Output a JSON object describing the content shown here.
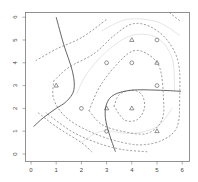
{
  "chart_data": {
    "type": "scatter",
    "title": "",
    "xlabel": "",
    "ylabel": "",
    "xlim": [
      -0.24,
      6.3
    ],
    "ylim": [
      -0.24,
      6.24
    ],
    "grid": false,
    "x_ticks": [
      0,
      1,
      2,
      3,
      4,
      5,
      6
    ],
    "y_ticks": [
      0,
      1,
      2,
      3,
      4,
      5,
      6
    ],
    "series": [
      {
        "name": "circles",
        "marker": "circle",
        "points": [
          [
            5,
            5
          ],
          [
            3,
            4
          ],
          [
            4,
            4
          ],
          [
            5,
            3
          ],
          [
            2,
            2
          ],
          [
            3,
            1
          ]
        ]
      },
      {
        "name": "triangles",
        "marker": "triangle",
        "points": [
          [
            4,
            5
          ],
          [
            5,
            4
          ],
          [
            1,
            3
          ],
          [
            3,
            2
          ],
          [
            4,
            2
          ],
          [
            5,
            1
          ]
        ]
      }
    ],
    "decision_boundary": [
      {
        "style": "solid",
        "points": [
          [
            1,
            6
          ],
          [
            1.3,
            4.8
          ],
          [
            1.65,
            3.6
          ],
          [
            1.7,
            2.8
          ],
          [
            1.4,
            2.3
          ],
          [
            1,
            2
          ],
          [
            0.5,
            1.6
          ],
          [
            0.1,
            1.2
          ]
        ]
      },
      {
        "style": "solid",
        "points": [
          [
            3.35,
            0.1
          ],
          [
            3.1,
            0.9
          ],
          [
            2.95,
            1.6
          ],
          [
            3,
            2.2
          ],
          [
            3.3,
            2.6
          ],
          [
            4,
            2.8
          ],
          [
            5,
            2.8
          ],
          [
            5.95,
            2.75
          ]
        ]
      }
    ],
    "margin_contours": [
      {
        "style": "dashed",
        "points": [
          [
            0.2,
            4.1
          ],
          [
            1,
            4.6
          ],
          [
            2,
            5.1
          ],
          [
            3,
            5.9
          ]
        ]
      },
      {
        "style": "dashed",
        "points": [
          [
            0.9,
            3.2
          ],
          [
            1.5,
            3.8
          ],
          [
            2.5,
            4.4
          ],
          [
            3.3,
            5.2
          ],
          [
            4,
            5.7
          ],
          [
            4.7,
            5.6
          ],
          [
            5.4,
            5
          ],
          [
            5.85,
            4
          ],
          [
            5.9,
            2.5
          ],
          [
            5.8,
            1.2
          ],
          [
            5.2,
            0.6
          ],
          [
            4.3,
            0.4
          ],
          [
            3.3,
            0.6
          ],
          [
            2.3,
            1
          ],
          [
            1.4,
            1.6
          ],
          [
            0.9,
            2.4
          ],
          [
            0.9,
            3.2
          ]
        ]
      },
      {
        "style": "dashed",
        "points": [
          [
            4.6,
            0.1
          ],
          [
            3.6,
            0.2
          ],
          [
            2.6,
            0.5
          ],
          [
            1.6,
            1
          ],
          [
            0.6,
            1.8
          ]
        ]
      },
      {
        "style": "dashed",
        "points": [
          [
            2.3,
            1.9
          ],
          [
            2.7,
            2.9
          ],
          [
            3.3,
            3.8
          ],
          [
            4,
            4.5
          ],
          [
            4.6,
            4.4
          ],
          [
            5.1,
            3.8
          ],
          [
            5.25,
            2.6
          ],
          [
            5.2,
            1.5
          ],
          [
            4.6,
            0.9
          ],
          [
            3.6,
            1
          ],
          [
            2.8,
            1.3
          ],
          [
            2.3,
            1.9
          ]
        ]
      },
      {
        "style": "dashed",
        "points": [
          [
            3.3,
            2.1
          ],
          [
            3.5,
            2.6
          ],
          [
            4,
            2.8
          ],
          [
            4.4,
            2.6
          ],
          [
            4.5,
            2
          ],
          [
            4.2,
            1.5
          ],
          [
            3.7,
            1.5
          ],
          [
            3.3,
            2.1
          ]
        ]
      },
      {
        "style": "dashed",
        "points": [
          [
            0.3,
            1.8
          ],
          [
            1,
            1.2
          ],
          [
            2,
            0.5
          ],
          [
            2.4,
            0.1
          ]
        ]
      },
      {
        "style": "dashed",
        "points": [
          [
            5.5,
            6.2
          ],
          [
            5.95,
            5.8
          ]
        ]
      }
    ],
    "light_contours": [
      {
        "style": "solid-light",
        "points": [
          [
            2.8,
            5.4
          ],
          [
            3.8,
            5.9
          ],
          [
            5,
            5.8
          ],
          [
            5.9,
            5.2
          ]
        ]
      },
      {
        "style": "solid-light",
        "points": [
          [
            1.8,
            2.6
          ],
          [
            2.2,
            3.5
          ],
          [
            3,
            4.5
          ],
          [
            4,
            5.2
          ],
          [
            5,
            5.1
          ],
          [
            5.6,
            4.2
          ],
          [
            5.7,
            2.8
          ]
        ]
      },
      {
        "style": "solid-light",
        "points": [
          [
            2,
            0.5
          ],
          [
            2.8,
            1
          ],
          [
            4,
            0.9
          ],
          [
            5,
            1.2
          ],
          [
            5.6,
            2
          ]
        ]
      }
    ]
  },
  "axes": {
    "x_tick_labels": [
      "0",
      "1",
      "2",
      "3",
      "4",
      "5",
      "6"
    ],
    "y_tick_labels": [
      "0",
      "1",
      "2",
      "3",
      "4",
      "5",
      "6"
    ]
  },
  "colors": {
    "boundary": "#555555",
    "margin": "#9a9a9a",
    "light": "#e6e6e6",
    "points": "#666666",
    "frame": "#777777",
    "tick_text": "#444444"
  }
}
